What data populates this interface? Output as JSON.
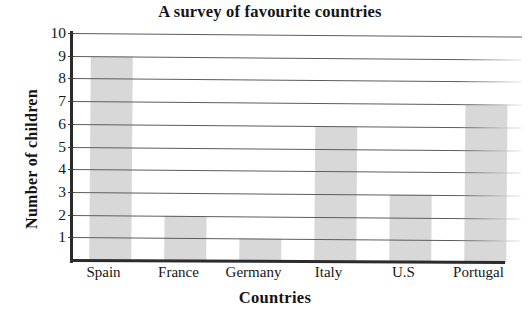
{
  "chart_data": {
    "type": "bar",
    "title": "A survey of favourite countries",
    "xlabel": "Countries",
    "ylabel": "Number of children",
    "categories": [
      "Spain",
      "France",
      "Germany",
      "Italy",
      "U.S",
      "Portugal"
    ],
    "values": [
      9,
      2,
      1,
      6,
      3,
      7
    ],
    "ylim": [
      0,
      10
    ],
    "ytick_labels": [
      "1",
      "2",
      "3",
      "4",
      "5",
      "6",
      "7",
      "8",
      "9",
      "10"
    ],
    "ytick_values": [
      1,
      2,
      3,
      4,
      5,
      6,
      7,
      8,
      9,
      10
    ],
    "grid": true,
    "grid_axis": "y",
    "legend": false,
    "bar_color": "#d8d8d8",
    "gridline_color": "#5d5d5d",
    "axis_color": "#2b2b2b",
    "text_color": "#141414",
    "background_color": "#ffffff"
  }
}
